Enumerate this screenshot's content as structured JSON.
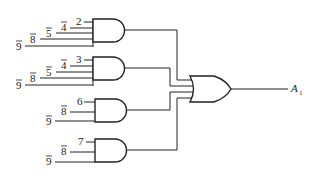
{
  "diagram": {
    "type": "logic-circuit",
    "gates": [
      {
        "id": "and1",
        "kind": "AND",
        "inputs": [
          {
            "label": "2",
            "negated": false
          },
          {
            "label": "4",
            "negated": true
          },
          {
            "label": "5",
            "negated": true
          },
          {
            "label": "8",
            "negated": true
          },
          {
            "label": "9",
            "negated": true
          }
        ]
      },
      {
        "id": "and2",
        "kind": "AND",
        "inputs": [
          {
            "label": "3",
            "negated": false
          },
          {
            "label": "4",
            "negated": true
          },
          {
            "label": "5",
            "negated": true
          },
          {
            "label": "8",
            "negated": true
          },
          {
            "label": "9",
            "negated": true
          }
        ]
      },
      {
        "id": "and3",
        "kind": "AND",
        "inputs": [
          {
            "label": "6",
            "negated": false
          },
          {
            "label": "8",
            "negated": true
          },
          {
            "label": "9",
            "negated": true
          }
        ]
      },
      {
        "id": "and4",
        "kind": "AND",
        "inputs": [
          {
            "label": "7",
            "negated": false
          },
          {
            "label": "8",
            "negated": true
          },
          {
            "label": "9",
            "negated": true
          }
        ]
      },
      {
        "id": "or1",
        "kind": "OR",
        "inputs": [
          "and1",
          "and2",
          "and3",
          "and4"
        ]
      }
    ],
    "output": {
      "label": "A",
      "subscript": "1"
    }
  }
}
